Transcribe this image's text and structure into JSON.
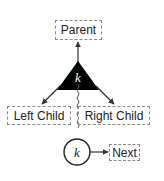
{
  "diagram": {
    "parent_label": "Parent",
    "left_child_label": "Left Child",
    "right_child_label": "Right Child",
    "next_label": "Next",
    "node_key": "k",
    "list_key": "k",
    "colors": {
      "node_fill": "#000000",
      "node_text": "#ffffff",
      "stroke": "#333333",
      "box_border": "#8a8a8a"
    }
  }
}
